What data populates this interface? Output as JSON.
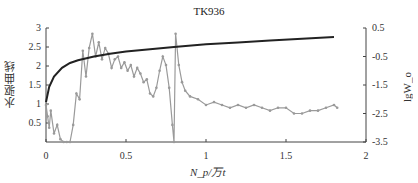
{
  "chart_data": {
    "type": "line",
    "title": "TK936",
    "xlabel": "N_p/万t",
    "ylabel": "水驱曲线",
    "y2label": "lgW_o",
    "xlim": [
      0,
      2
    ],
    "ylim": [
      0,
      3
    ],
    "y2lim": [
      -3.5,
      0.5
    ],
    "x_ticks": [
      "0",
      "0.5",
      "1",
      "1.5",
      "2"
    ],
    "y_ticks": [
      "0.5",
      "1",
      "1.5",
      "2",
      "2.5",
      "3"
    ],
    "y2_ticks": [
      "0.5",
      "-0.5",
      "-1.5",
      "-2.5",
      "-3.5"
    ],
    "grid": false,
    "legend": "none",
    "series": [
      {
        "name": "水驱曲线",
        "axis": "left",
        "color": "#222222",
        "style": "smooth-line",
        "x": [
          0,
          0.02,
          0.05,
          0.1,
          0.15,
          0.2,
          0.3,
          0.4,
          0.5,
          0.6,
          0.8,
          1.0,
          1.2,
          1.4,
          1.6,
          1.8
        ],
        "values": [
          1.05,
          1.45,
          1.72,
          1.95,
          2.08,
          2.15,
          2.25,
          2.32,
          2.38,
          2.42,
          2.5,
          2.57,
          2.62,
          2.67,
          2.72,
          2.76
        ]
      },
      {
        "name": "lgW_o",
        "axis": "right",
        "color": "#9a9a9a",
        "style": "line-markers",
        "x": [
          0.0,
          0.01,
          0.02,
          0.03,
          0.05,
          0.07,
          0.09,
          0.11,
          0.13,
          0.15,
          0.17,
          0.19,
          0.21,
          0.23,
          0.25,
          0.27,
          0.29,
          0.31,
          0.33,
          0.35,
          0.37,
          0.39,
          0.41,
          0.43,
          0.45,
          0.47,
          0.49,
          0.51,
          0.53,
          0.55,
          0.57,
          0.59,
          0.61,
          0.63,
          0.65,
          0.67,
          0.69,
          0.71,
          0.73,
          0.75,
          0.77,
          0.79,
          0.8,
          0.81,
          0.83,
          0.85,
          0.87,
          0.9,
          0.95,
          1.0,
          1.05,
          1.1,
          1.15,
          1.2,
          1.25,
          1.3,
          1.35,
          1.4,
          1.45,
          1.5,
          1.55,
          1.6,
          1.65,
          1.7,
          1.75,
          1.8,
          1.82
        ],
        "values": [
          -2.2,
          -2.6,
          -3.0,
          -2.4,
          -3.2,
          -2.9,
          -3.4,
          -3.5,
          -3.5,
          -3.5,
          -2.9,
          -1.8,
          -2.0,
          -0.3,
          -1.2,
          -0.2,
          0.3,
          -0.5,
          0.0,
          -0.6,
          -0.2,
          -0.4,
          -0.9,
          -0.6,
          -0.5,
          -0.9,
          -0.7,
          -1.0,
          -0.8,
          -1.2,
          -0.9,
          -1.1,
          -1.4,
          -1.3,
          -1.8,
          -1.9,
          -1.6,
          -1.0,
          -0.5,
          -0.8,
          -1.6,
          -2.9,
          -3.5,
          0.3,
          -0.8,
          -1.4,
          -1.7,
          -1.9,
          -2.0,
          -2.2,
          -2.1,
          -2.2,
          -2.3,
          -2.2,
          -2.3,
          -2.2,
          -2.3,
          -2.4,
          -2.3,
          -2.3,
          -2.5,
          -2.5,
          -2.4,
          -2.4,
          -2.3,
          -2.2,
          -2.3
        ]
      }
    ]
  }
}
